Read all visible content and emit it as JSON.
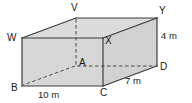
{
  "figure": {
    "type": "cuboid-net-diagram",
    "background_color": "#ffffff",
    "face_fill_front": "#d9d9d9",
    "face_fill_top": "#dcdcdc",
    "face_fill_side": "#d2d2d2",
    "edge_color": "#3c3c3c",
    "hidden_edge_color": "#4a4a4a",
    "label_color": "#1a1a1a"
  },
  "vertices": [
    {
      "id": "V",
      "label": "V",
      "x": 76,
      "y": 18,
      "label_x": 71,
      "label_y": 3,
      "hidden": false
    },
    {
      "id": "W",
      "label": "W",
      "x": 22,
      "y": 38,
      "label_x": 8,
      "label_y": 33,
      "hidden": false
    },
    {
      "id": "Y",
      "label": "Y",
      "x": 157,
      "y": 18,
      "label_x": 159,
      "label_y": 6,
      "hidden": false
    },
    {
      "id": "X",
      "label": "X",
      "x": 103,
      "y": 38,
      "label_x": 105,
      "label_y": 36,
      "hidden": false
    },
    {
      "id": "A",
      "label": "A",
      "x": 76,
      "y": 66,
      "label_x": 79,
      "label_y": 58,
      "hidden": true
    },
    {
      "id": "B",
      "label": "B",
      "x": 22,
      "y": 86,
      "label_x": 11,
      "label_y": 84,
      "hidden": false
    },
    {
      "id": "C",
      "label": "C",
      "x": 103,
      "y": 86,
      "label_x": 101,
      "label_y": 87,
      "hidden": false
    },
    {
      "id": "D",
      "label": "D",
      "x": 157,
      "y": 66,
      "label_x": 160,
      "label_y": 63,
      "hidden": false
    }
  ],
  "dimensions": [
    {
      "id": "width",
      "label": "10 m",
      "value": 10,
      "unit": "m",
      "edge": "B-C",
      "label_x": 38,
      "label_y": 90
    },
    {
      "id": "depth",
      "label": "7 m",
      "value": 7,
      "unit": "m",
      "edge": "C-D",
      "label_x": 125,
      "label_y": 77
    },
    {
      "id": "height",
      "label": "4 m",
      "value": 4,
      "unit": "m",
      "edge": "Y-D",
      "label_x": 161,
      "label_y": 32
    }
  ],
  "edges": {
    "visible": [
      "W-V",
      "V-Y",
      "Y-X",
      "X-W",
      "W-B",
      "X-C",
      "Y-D",
      "B-C",
      "C-D"
    ],
    "hidden": [
      "V-A",
      "A-B",
      "A-D"
    ]
  }
}
